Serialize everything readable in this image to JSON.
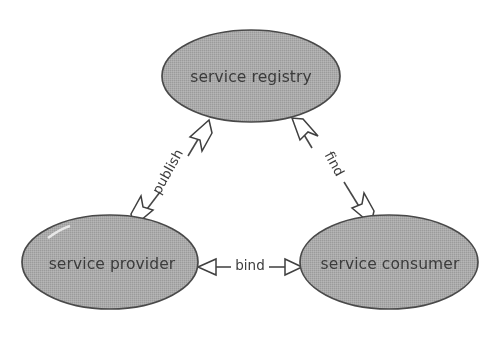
{
  "diagram": {
    "background_color": "#ffffff",
    "node_fill_color": "#a9a9a9",
    "node_stroke_color": "#4a4a4a",
    "text_color": "#3b3b3b",
    "arrow_fill_color": "#ffffff",
    "nodes": [
      {
        "id": "service-registry",
        "label": "service registry",
        "cx": 251,
        "cy": 76,
        "rx": 89,
        "ry": 46
      },
      {
        "id": "service-provider",
        "label": "service provider",
        "cx": 110,
        "cy": 262,
        "rx": 88,
        "ry": 47
      },
      {
        "id": "service-consumer",
        "label": "service consumer",
        "cx": 389,
        "cy": 262,
        "rx": 89,
        "ry": 47
      }
    ],
    "edges": [
      {
        "id": "publish",
        "label": "publish",
        "from": "service-provider",
        "to": "service-registry",
        "arrows": "both",
        "label_rotation_deg": -61,
        "label_x": 168,
        "label_y": 172
      },
      {
        "id": "find",
        "label": "find",
        "from": "service-registry",
        "to": "service-consumer",
        "arrows": "both",
        "label_rotation_deg": 61,
        "label_x": 334,
        "label_y": 164
      },
      {
        "id": "bind",
        "label": "bind",
        "from": "service-consumer",
        "to": "service-provider",
        "arrows": "both",
        "label_rotation_deg": 0,
        "label_x": 250,
        "label_y": 266
      }
    ]
  }
}
